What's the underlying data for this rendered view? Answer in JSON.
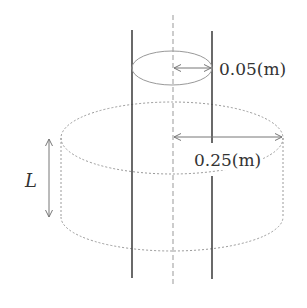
{
  "diagram": {
    "labels": {
      "inner_radius": "0.05(m)",
      "outer_radius": "0.25(m)",
      "length": "L"
    },
    "elements": {
      "inner_cylinder": {
        "description": "two vertical solid rods with top ellipse",
        "radius_label": "0.05(m)"
      },
      "outer_cylinder": {
        "description": "dashed large cylinder",
        "radius_label": "0.25(m)"
      },
      "axis": "dashed vertical center line",
      "height_arrow": "double-headed arrow labeled L"
    },
    "colors": {
      "rod": "#444444",
      "dashed": "#9a9a9a",
      "arrow": "#777777",
      "text": "#333333"
    }
  }
}
